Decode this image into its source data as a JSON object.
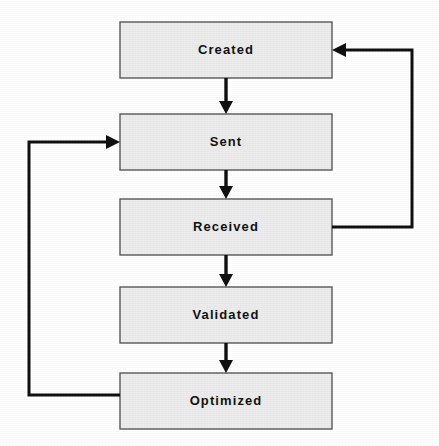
{
  "diagram": {
    "type": "flowchart",
    "background_color": "#ffffff",
    "node_fill_color": "#ececec",
    "node_border_color": "#5a5a5a",
    "line_color": "#101010",
    "text_color": "#121212",
    "nodes": [
      {
        "id": "created",
        "label": "Created",
        "x": 120,
        "y": 22,
        "width": 212,
        "height": 56
      },
      {
        "id": "sent",
        "label": "Sent",
        "x": 120,
        "y": 114,
        "width": 212,
        "height": 56
      },
      {
        "id": "received",
        "label": "Received",
        "x": 120,
        "y": 199,
        "width": 212,
        "height": 56
      },
      {
        "id": "validated",
        "label": "Validated",
        "x": 120,
        "y": 287,
        "width": 212,
        "height": 56
      },
      {
        "id": "optimized",
        "label": "Optimized",
        "x": 120,
        "y": 373,
        "width": 212,
        "height": 56
      }
    ],
    "edges": [
      {
        "id": "created-to-sent",
        "from": "created",
        "to": "sent",
        "kind": "straight-down"
      },
      {
        "id": "sent-to-received",
        "from": "sent",
        "to": "received",
        "kind": "straight-down"
      },
      {
        "id": "received-to-validated",
        "from": "received",
        "to": "validated",
        "kind": "straight-down"
      },
      {
        "id": "validated-to-optimized",
        "from": "validated",
        "to": "optimized",
        "kind": "straight-down"
      },
      {
        "id": "received-to-created",
        "from": "received",
        "to": "created",
        "kind": "loop-right"
      },
      {
        "id": "optimized-to-sent",
        "from": "optimized",
        "to": "sent",
        "kind": "loop-left"
      }
    ]
  }
}
